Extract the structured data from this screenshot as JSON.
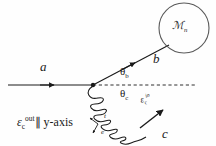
{
  "figure": {
    "name": "particle-scattering-diagram",
    "background_color": "#fefefe",
    "line_color": "#1a1a1a"
  },
  "labels": {
    "incoming_particle": "a",
    "outgoing_particle_b": "b",
    "outgoing_particle_c": "c",
    "mass_blob": "ℳ",
    "mass_blob_subscript": "n",
    "angle_b": "θ",
    "angle_b_subscript": "b",
    "angle_c": "θ",
    "angle_c_subscript": "c",
    "polarization_in": "ε",
    "polarization_in_subscript": "c",
    "polarization_in_superscript": "in",
    "polarization_out": "ε",
    "polarization_out_subscript": "c",
    "polarization_out_superscript": "out",
    "polarization_out_relation": "∥  y-axis",
    "axis_marker_label_1": "t",
    "axis_marker_label_2": "e"
  },
  "geometry": {
    "vertex": {
      "x": 93,
      "y": 85
    },
    "incoming_line_start": {
      "x": 8,
      "y": 85
    },
    "outgoing_b_end": {
      "x": 178,
      "y": 40
    },
    "dashed_axis_end": {
      "x": 196,
      "y": 85
    },
    "coil_end": {
      "x": 165,
      "y": 133
    },
    "blob_center": {
      "x": 184,
      "y": 28
    },
    "blob_radius": 25,
    "coil_turns": 7,
    "angle_b_degrees": 28,
    "angle_c_degrees": 32
  }
}
